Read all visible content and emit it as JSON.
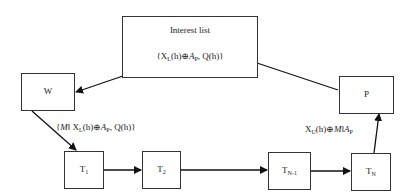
{
  "nodes": {
    "interest": {
      "title": "Interest list",
      "content": "{X_L(h)⊕A_P, Q(h)}"
    },
    "w": {
      "label": "W"
    },
    "p": {
      "label": "P"
    },
    "t1": {
      "label": "T",
      "sub": "1"
    },
    "t2": {
      "label": "T",
      "sub": "2"
    },
    "tn1": {
      "label": "T",
      "sub": "N-1"
    },
    "tn": {
      "label": "T",
      "sub": "N"
    }
  },
  "edges": {
    "w_to_t1": {
      "label": "{M‖X_L(h)⊕A_P, Q(h)}"
    },
    "tn_to_p": {
      "label": "X_U(h)⊕M‖A_P"
    }
  },
  "text": {
    "brace_open": "{",
    "x": "X",
    "sub_L": "L",
    "sub_U": "U",
    "h": "(h)⊕",
    "a": "A",
    "sub_P": "P",
    "comma_q": ", Q(h)}",
    "m": "M",
    "dbar": "‖"
  }
}
